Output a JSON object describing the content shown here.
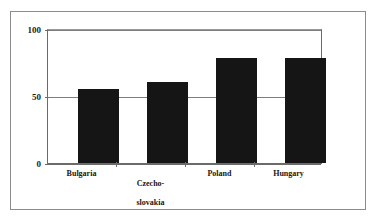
{
  "chart_data": {
    "type": "bar",
    "title": "",
    "subtitle": "",
    "xlabel": "",
    "ylabel": "",
    "categories": [
      "Bulgaria",
      "Czecho-\nslovakia",
      "Poland",
      "Hungary"
    ],
    "values": [
      56,
      61,
      79,
      79
    ],
    "ylim": [
      0,
      100
    ],
    "yticks": [
      0,
      50,
      100
    ],
    "ytick_labels": [
      "0",
      "50",
      "100"
    ],
    "grid": true,
    "grid_axis": "y",
    "legend": false,
    "legend_position": "none",
    "bar_color": "#151515",
    "axis_color": "#6b6b6b",
    "frame_color": "#8c8c8c",
    "background": "#ffffff"
  },
  "axis": {
    "y_tick_top": "100",
    "y_tick_mid": "50",
    "y_tick_bottom": "0"
  },
  "categories_display": {
    "c0": "Bulgaria",
    "c1_line1": "Czecho-",
    "c1_line2": "slovakia",
    "c2": "Poland",
    "c3": "Hungary"
  }
}
